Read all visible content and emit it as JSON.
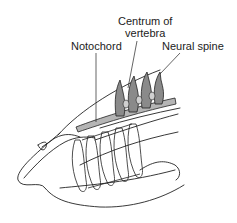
{
  "diagram": {
    "labels": {
      "centrum_line1": "Centrum of",
      "centrum_line2": "vertebra",
      "notochord": "Notochord",
      "neural_spine": "Neural spine"
    },
    "colors": {
      "line": "#222222",
      "vertebra_fill": "#8a8a8a",
      "notochord_fill": "#b5b5b5",
      "background": "#ffffff"
    }
  }
}
